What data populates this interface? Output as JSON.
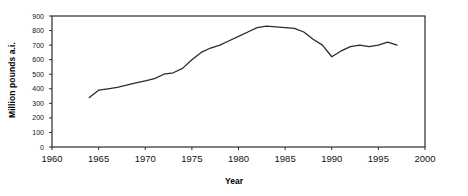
{
  "chart_data": {
    "type": "line",
    "title": "",
    "xlabel": "Year",
    "ylabel": "Million pounds a.i.",
    "xlim": [
      1960,
      2000
    ],
    "ylim": [
      0,
      900
    ],
    "xticks": [
      1960,
      1965,
      1970,
      1975,
      1980,
      1985,
      1990,
      1995,
      2000
    ],
    "yticks": [
      0,
      100,
      200,
      300,
      400,
      500,
      600,
      700,
      800,
      900
    ],
    "grid": false,
    "legend": null,
    "series": [
      {
        "name": "Million pounds a.i.",
        "color": "#2b2b2b",
        "x": [
          1964,
          1965,
          1966,
          1967,
          1968,
          1969,
          1970,
          1971,
          1972,
          1973,
          1974,
          1975,
          1976,
          1977,
          1978,
          1979,
          1980,
          1981,
          1982,
          1983,
          1984,
          1985,
          1986,
          1987,
          1988,
          1989,
          1990,
          1991,
          1992,
          1993,
          1994,
          1995,
          1996,
          1997
        ],
        "values": [
          340,
          390,
          400,
          410,
          425,
          440,
          455,
          470,
          500,
          510,
          540,
          600,
          650,
          680,
          700,
          730,
          760,
          790,
          820,
          830,
          825,
          820,
          815,
          790,
          740,
          700,
          620,
          660,
          690,
          700,
          690,
          700,
          720,
          700
        ]
      }
    ]
  },
  "axis": {
    "x_tick_labels": [
      "1960",
      "1965",
      "1970",
      "1975",
      "1980",
      "1985",
      "1990",
      "1995",
      "2000"
    ],
    "y_tick_labels": [
      "900",
      "800",
      "700",
      "600",
      "500",
      "400",
      "300",
      "200",
      "100",
      "0"
    ]
  }
}
